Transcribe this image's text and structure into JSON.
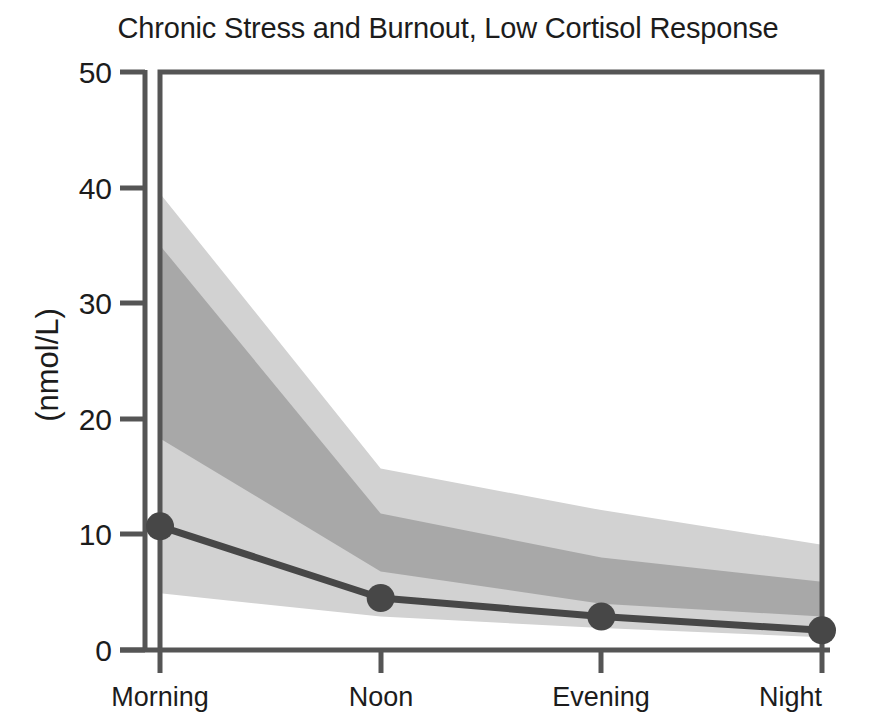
{
  "chart_data": {
    "type": "line",
    "title": "Chronic Stress and Burnout, Low Cortisol Response",
    "xlabel": "",
    "ylabel": "(nmol/L)",
    "categories": [
      "Morning",
      "Noon",
      "Evening",
      "Night"
    ],
    "yticks": [
      0,
      10,
      20,
      30,
      40,
      50
    ],
    "ylim": [
      0,
      50
    ],
    "grid": false,
    "legend": "none",
    "series": [
      {
        "name": "Median cortisol",
        "values": [
          10.7,
          4.5,
          2.9,
          1.7
        ],
        "marker": "circle",
        "color": "#474747"
      }
    ],
    "bands": [
      {
        "name": "Outer range",
        "shade": "light",
        "color": "#d2d2d2",
        "upper": [
          39.5,
          15.7,
          12.1,
          9.1
        ],
        "lower": [
          4.9,
          2.9,
          1.9,
          1.1
        ]
      },
      {
        "name": "Inner range",
        "shade": "dark",
        "color": "#a8a8a8",
        "upper": [
          35.0,
          11.8,
          8.0,
          5.9
        ],
        "lower": [
          18.3,
          6.8,
          4.0,
          2.9
        ]
      }
    ]
  },
  "axis": {
    "y_tick_labels": [
      "50",
      "40",
      "30",
      "20",
      "10",
      "0"
    ],
    "y_axis_title": "(nmol/L)",
    "x_tick_labels": [
      "Morning",
      "Noon",
      "Evening",
      "Night"
    ]
  }
}
